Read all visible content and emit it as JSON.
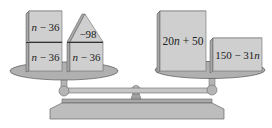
{
  "diagram": {
    "type": "balance-scale",
    "colors": {
      "block_face": "#cfcfcf",
      "block_side": "#a8a8a8",
      "block_top": "#e0e0e0",
      "pan": "#b0b0b0",
      "beam": "#b8b8b8",
      "base": "#bdbdbd",
      "outline": "#555555",
      "text": "#222222"
    },
    "left_pan": {
      "blocks": [
        {
          "label_var": "n",
          "label_rest": " − 36",
          "position": "top-left"
        },
        {
          "label_var": "n",
          "label_rest": " − 36",
          "position": "bottom-left"
        },
        {
          "label_var": "n",
          "label_rest": " − 36",
          "position": "bottom-right"
        }
      ],
      "triangle": {
        "label": "−98",
        "position": "top-right"
      }
    },
    "right_pan": {
      "blocks": [
        {
          "label_pre": "20",
          "label_var": "n",
          "label_post": " + 50",
          "position": "tall-left"
        },
        {
          "label_pre": "150 − 31",
          "label_var": "n",
          "label_post": "",
          "position": "short-right"
        }
      ]
    }
  }
}
